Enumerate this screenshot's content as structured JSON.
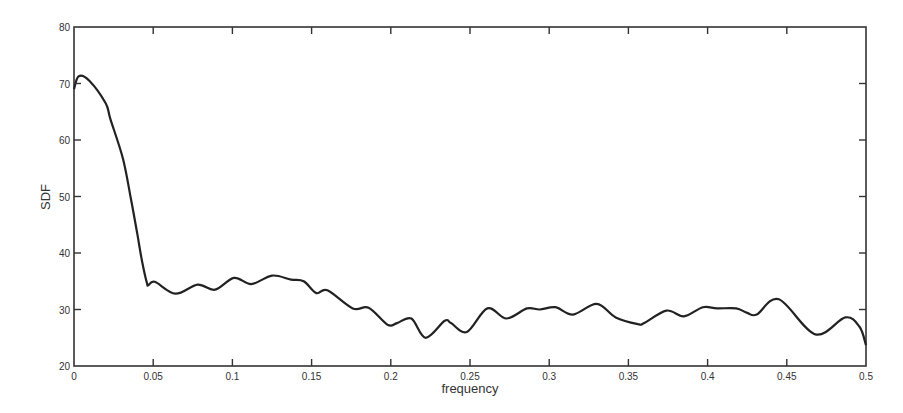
{
  "chart_data": {
    "type": "line",
    "title": "",
    "xlabel": "frequency",
    "ylabel": "SDF",
    "xlim": [
      0,
      0.5
    ],
    "ylim": [
      20,
      80
    ],
    "xticks": [
      0,
      0.05,
      0.1,
      0.15,
      0.2,
      0.25,
      0.3,
      0.35,
      0.4,
      0.45,
      0.5
    ],
    "xtick_labels": [
      "0",
      "0.05",
      "0.1",
      "0.15",
      "0.2",
      "0.25",
      "0.3",
      "0.35",
      "0.4",
      "0.45",
      "0.5"
    ],
    "yticks": [
      20,
      30,
      40,
      50,
      60,
      70,
      80
    ],
    "ytick_labels": [
      "20",
      "30",
      "40",
      "50",
      "60",
      "70",
      "80"
    ],
    "grid": false,
    "legend": null,
    "line_color": "#222222",
    "series": [
      {
        "name": "SDF",
        "x": [
          0.0,
          0.003,
          0.01,
          0.02,
          0.023,
          0.031,
          0.036,
          0.04,
          0.043,
          0.046,
          0.047,
          0.051,
          0.064,
          0.078,
          0.089,
          0.101,
          0.112,
          0.125,
          0.137,
          0.145,
          0.153,
          0.16,
          0.176,
          0.186,
          0.198,
          0.204,
          0.213,
          0.222,
          0.234,
          0.238,
          0.248,
          0.261,
          0.273,
          0.286,
          0.294,
          0.304,
          0.315,
          0.33,
          0.342,
          0.356,
          0.36,
          0.374,
          0.385,
          0.397,
          0.406,
          0.418,
          0.425,
          0.431,
          0.445,
          0.468,
          0.487,
          0.496,
          0.5
        ],
        "y": [
          69.0,
          71.3,
          70.4,
          66.5,
          63.7,
          56.6,
          49.5,
          43.3,
          38.5,
          34.7,
          34.3,
          34.9,
          32.8,
          34.4,
          33.5,
          35.6,
          34.5,
          36.0,
          35.3,
          35.0,
          32.9,
          33.4,
          30.2,
          30.3,
          27.3,
          27.6,
          28.4,
          25.0,
          28.0,
          27.6,
          26.0,
          30.2,
          28.4,
          30.2,
          30.0,
          30.4,
          29.1,
          31.0,
          28.6,
          27.4,
          27.6,
          29.8,
          28.8,
          30.4,
          30.2,
          30.2,
          29.4,
          29.1,
          31.8,
          25.6,
          28.6,
          26.9,
          23.7
        ]
      }
    ]
  }
}
